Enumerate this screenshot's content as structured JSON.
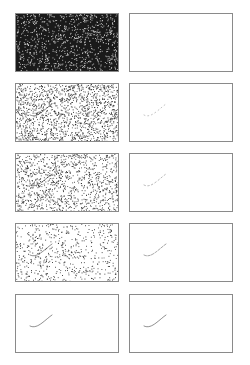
{
  "figure": {
    "layout": {
      "rows": 5,
      "columns": 2
    },
    "colors": {
      "border": "#8a8a8a",
      "ink": "#333333",
      "background": "#ffffff",
      "noise_dark": "#1a1a1a"
    },
    "columns": [
      {
        "role": "noisy-input",
        "description": "Lion line drawing corrupted by decreasing amounts of noise"
      },
      {
        "role": "reconstruction",
        "description": "Recovered lion line drawing, from blank to complete"
      }
    ],
    "rows": [
      {
        "left_noise_density": 0.78,
        "left_dark_background": true,
        "right_visibility": 0.0
      },
      {
        "left_noise_density": 0.55,
        "left_dark_background": false,
        "right_visibility": 0.18
      },
      {
        "left_noise_density": 0.42,
        "left_dark_background": false,
        "right_visibility": 0.35
      },
      {
        "left_noise_density": 0.22,
        "left_dark_background": false,
        "right_visibility": 0.7
      },
      {
        "left_noise_density": 0.0,
        "left_dark_background": false,
        "right_visibility": 1.0
      }
    ],
    "subject_icon": "walking-lion-line-drawing"
  }
}
